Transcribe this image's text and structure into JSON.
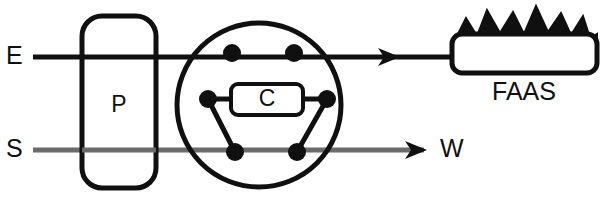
{
  "figure": {
    "canvas": {
      "width": 602,
      "height": 216,
      "background": "#ffffff"
    }
  },
  "colors": {
    "eluent_line": "#101010",
    "sample_line": "#6b6b6b",
    "stroke": "#101010",
    "node_fill": "#101010",
    "box_fill": "#ffffff",
    "text": "#101010"
  },
  "labels": {
    "eluent": "E",
    "sample": "S",
    "waste": "W",
    "pump": "P",
    "loop": "C",
    "detector": "FAAS"
  },
  "components": {
    "pump": {
      "name": "P",
      "shape": "rounded-rectangle",
      "x": 82,
      "y": 16,
      "width": 74,
      "height": 172,
      "radius": 20,
      "stroke_width": 5
    },
    "valve": {
      "shape": "circle",
      "cx": 259,
      "cy": 105,
      "r": 82,
      "stroke_width": 5,
      "ports": [
        {
          "id": "port-top-left",
          "cx": 232,
          "cy": 53,
          "r": 9
        },
        {
          "id": "port-top-right",
          "cx": 294,
          "cy": 53,
          "r": 9
        },
        {
          "id": "port-mid-left",
          "cx": 208,
          "cy": 99,
          "r": 9
        },
        {
          "id": "port-mid-right",
          "cx": 327,
          "cy": 99,
          "r": 9
        },
        {
          "id": "port-bottom-left",
          "cx": 235,
          "cy": 152,
          "r": 9
        },
        {
          "id": "port-bottom-right",
          "cx": 297,
          "cy": 152,
          "r": 9
        }
      ],
      "internal_connectors": [
        {
          "id": "connector-left-diagonal",
          "from": "port-mid-left",
          "to": "port-bottom-left"
        },
        {
          "id": "connector-right-diagonal",
          "from": "port-mid-right",
          "to": "port-bottom-right"
        },
        {
          "id": "connector-top-bridge",
          "from": "port-top-left",
          "to": "port-top-right"
        }
      ]
    },
    "sample_loop": {
      "name": "C",
      "shape": "rounded-rectangle",
      "x": 231,
      "y": 84,
      "width": 72,
      "height": 31,
      "radius": 7,
      "stroke_width": 4
    },
    "detector": {
      "name": "FAAS",
      "shape": "rounded-rectangle",
      "x": 452,
      "y": 34,
      "width": 145,
      "height": 39,
      "radius": 10,
      "stroke_width": 5,
      "flame": {
        "present": true,
        "points": 7
      },
      "caption_x": 524,
      "caption_y": 93
    }
  },
  "streams": [
    {
      "id": "eluent-stream",
      "label": "E",
      "color": "#101010",
      "stroke_width": 5,
      "y": 57,
      "label_x": 10,
      "label_y": 57,
      "from_x": 33,
      "to_x": 452,
      "arrow_x": 395,
      "arrow": true
    },
    {
      "id": "sample-stream",
      "label": "S",
      "color": "#6b6b6b",
      "stroke_width": 5,
      "y": 150,
      "label_x": 10,
      "label_y": 150,
      "from_x": 33,
      "to_x": 424,
      "arrow_x": 424,
      "arrow": true,
      "end_label": "W",
      "end_label_x": 444,
      "end_label_y": 150
    }
  ]
}
